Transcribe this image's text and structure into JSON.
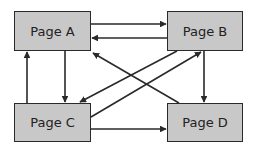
{
  "diagram": {
    "nodes": [
      {
        "id": "A",
        "label": "Page A"
      },
      {
        "id": "B",
        "label": "Page B"
      },
      {
        "id": "C",
        "label": "Page C"
      },
      {
        "id": "D",
        "label": "Page D"
      }
    ],
    "edges": [
      {
        "from": "A",
        "to": "B"
      },
      {
        "from": "B",
        "to": "A"
      },
      {
        "from": "A",
        "to": "C"
      },
      {
        "from": "C",
        "to": "A"
      },
      {
        "from": "B",
        "to": "D"
      },
      {
        "from": "C",
        "to": "D"
      },
      {
        "from": "D",
        "to": "A"
      },
      {
        "from": "B",
        "to": "C"
      },
      {
        "from": "C",
        "to": "B"
      }
    ],
    "colors": {
      "node_fill": "#c8c8c8",
      "stroke": "#2a2a2a",
      "background": "#ffffff"
    }
  }
}
